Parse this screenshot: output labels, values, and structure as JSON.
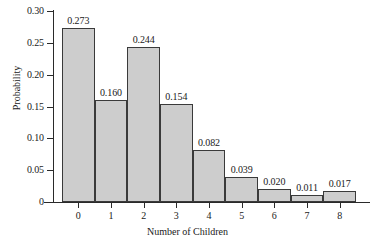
{
  "chart_data": {
    "type": "bar",
    "title": "",
    "xlabel": "Number of Children",
    "ylabel": "Probability",
    "categories": [
      "0",
      "1",
      "2",
      "3",
      "4",
      "5",
      "6",
      "7",
      "8"
    ],
    "values": [
      0.273,
      0.16,
      0.244,
      0.154,
      0.082,
      0.039,
      0.02,
      0.011,
      0.017
    ],
    "value_labels": [
      "0.273",
      "0.160",
      "0.244",
      "0.154",
      "0.082",
      "0.039",
      "0.020",
      "0.011",
      "0.017"
    ],
    "ylim": [
      0,
      0.3
    ],
    "ytick_values": [
      0.3,
      0.25,
      0.2,
      0.15,
      0.1,
      0.05,
      0
    ],
    "ytick_labels": [
      "0.30",
      "0.25",
      "0.20",
      "0.15",
      "0.10",
      "0.05",
      "0"
    ],
    "grid": false,
    "legend": false,
    "bar_fill_color": "#cdcdcd",
    "bar_border_color": "#3a3a3a",
    "axis_color": "#2a2a2a",
    "background_color": "#ffffff"
  }
}
